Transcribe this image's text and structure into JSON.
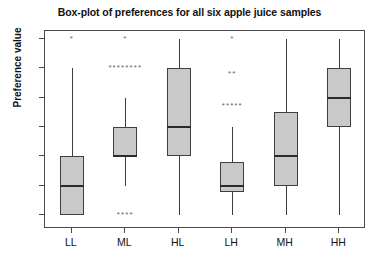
{
  "chart_data": {
    "type": "box",
    "title": "Box-plot of preferences for all six apple juice samples",
    "xlabel": "",
    "ylabel": "Preference value",
    "ylim": [
      1,
      7
    ],
    "yticks": [
      1,
      2,
      3,
      4,
      5,
      6,
      7
    ],
    "ytick_labels": [
      "1",
      "2",
      "3",
      "4",
      "5",
      "6",
      "7"
    ],
    "grid": false,
    "legend": "none",
    "categories": [
      "LL",
      "ML",
      "HL",
      "LH",
      "MH",
      "HH"
    ],
    "boxes": [
      {
        "category": "LL",
        "whisker_low": 1,
        "q1": 1,
        "median": 2,
        "q3": 3,
        "whisker_high": 6,
        "outliers": [
          {
            "value": 7,
            "count": 1,
            "marker": "*"
          }
        ]
      },
      {
        "category": "ML",
        "whisker_low": 2,
        "q1": 3,
        "median": 3,
        "q3": 4,
        "whisker_high": 5,
        "outliers": [
          {
            "value": 7,
            "count": 1,
            "marker": "*"
          },
          {
            "value": 6,
            "count": 8,
            "marker": "*"
          },
          {
            "value": 1,
            "count": 4,
            "marker": "*"
          }
        ]
      },
      {
        "category": "HL",
        "whisker_low": 1,
        "q1": 3,
        "median": 4,
        "q3": 6,
        "whisker_high": 7,
        "outliers": []
      },
      {
        "category": "LH",
        "whisker_low": 1,
        "q1": 1.8,
        "median": 2,
        "q3": 2.8,
        "whisker_high": 4,
        "outliers": [
          {
            "value": 7,
            "count": 1,
            "marker": "*"
          },
          {
            "value": 5.8,
            "count": 2,
            "marker": "*"
          },
          {
            "value": 4.7,
            "count": 5,
            "marker": "*"
          }
        ]
      },
      {
        "category": "MH",
        "whisker_low": 1,
        "q1": 2,
        "median": 3,
        "q3": 4.5,
        "whisker_high": 7,
        "outliers": []
      },
      {
        "category": "HH",
        "whisker_low": 1,
        "q1": 4,
        "median": 5,
        "q3": 6,
        "whisker_high": 7,
        "outliers": []
      }
    ],
    "colors": {
      "box_fill": "#c9c9c9",
      "box_edge": "#3f3f3f",
      "median": "#2b2b2b",
      "whisker": "#3c3c3c",
      "outlier": "#666666",
      "axis": "#4a4a4a",
      "background": "#ffffff",
      "text": "#111111"
    }
  }
}
